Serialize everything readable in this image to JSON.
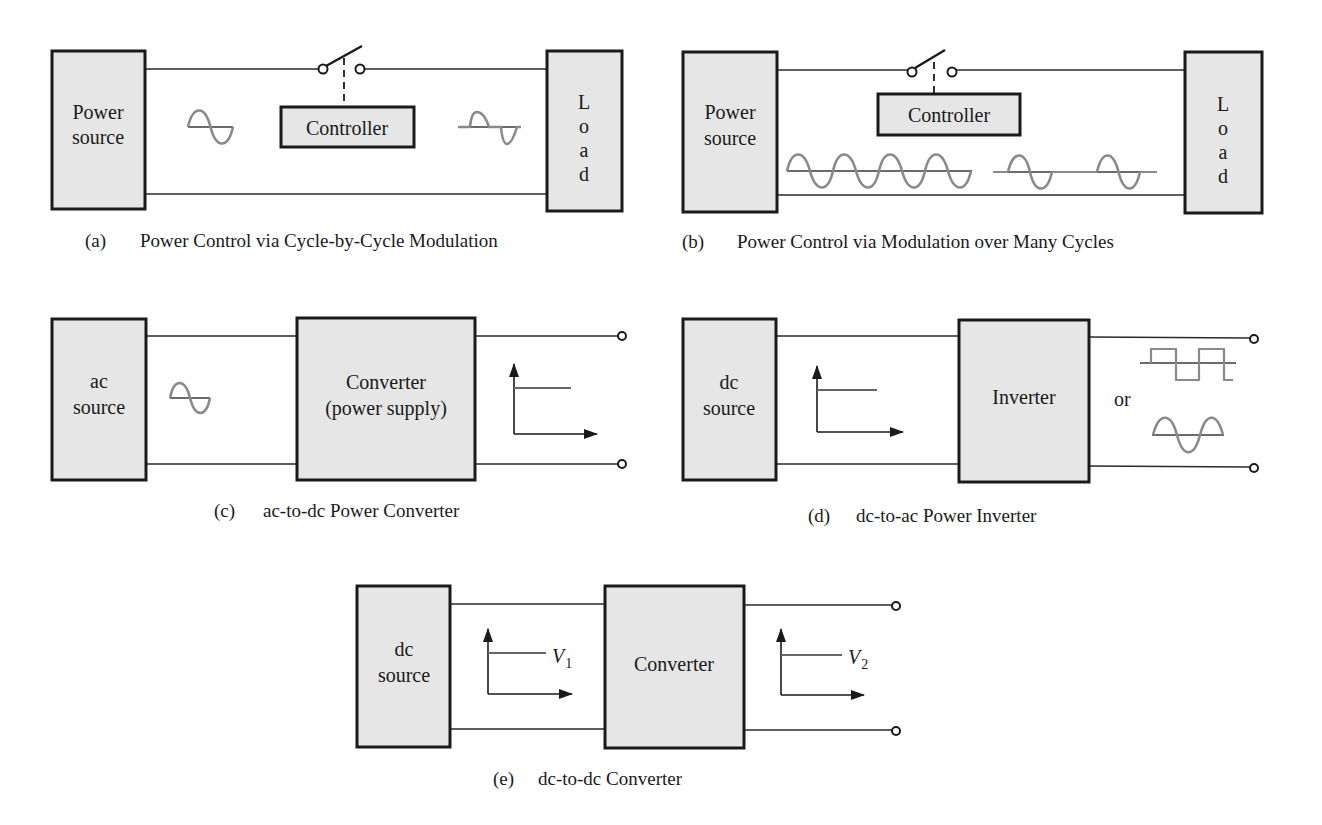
{
  "panels": {
    "a": {
      "caption_tag": "(a)",
      "caption": "Power Control via Cycle-by-Cycle Modulation",
      "source_line1": "Power",
      "source_line2": "source",
      "controller": "Controller",
      "load_letters": [
        "L",
        "o",
        "a",
        "d"
      ],
      "input_waveform": "sine-wave-icon",
      "output_waveform": "phase-controlled-sine-icon"
    },
    "b": {
      "caption_tag": "(b)",
      "caption": "Power Control via Modulation over Many Cycles",
      "source_line1": "Power",
      "source_line2": "source",
      "controller": "Controller",
      "load_letters": [
        "L",
        "o",
        "a",
        "d"
      ],
      "input_waveform": "continuous-sine-4-cycles",
      "output_waveform": "burst-sine-2-cycles"
    },
    "c": {
      "caption_tag": "(c)",
      "caption": "ac-to-dc Power Converter",
      "source_line1": "ac",
      "source_line2": "source",
      "block_line1": "Converter",
      "block_line2": "(power supply)",
      "input_waveform": "sine-wave-icon",
      "output_waveform": "dc-level-plot"
    },
    "d": {
      "caption_tag": "(d)",
      "caption": "dc-to-ac Power Inverter",
      "source_line1": "dc",
      "source_line2": "source",
      "block": "Inverter",
      "or_label": "or",
      "input_waveform": "dc-level-plot",
      "output_waveforms": [
        "square-wave",
        "sine-wave"
      ]
    },
    "e": {
      "caption_tag": "(e)",
      "caption": "dc-to-dc Converter",
      "source_line1": "dc",
      "source_line2": "source",
      "block": "Converter",
      "v1_symbol": "V",
      "v1_sub": "1",
      "v2_symbol": "V",
      "v2_sub": "2",
      "input_waveform": "dc-level-plot",
      "output_waveform": "dc-level-plot"
    }
  },
  "colors": {
    "block_fill": "#e6e6e6",
    "outline": "#1a1a1a",
    "waveform": "#8a8a8a"
  }
}
